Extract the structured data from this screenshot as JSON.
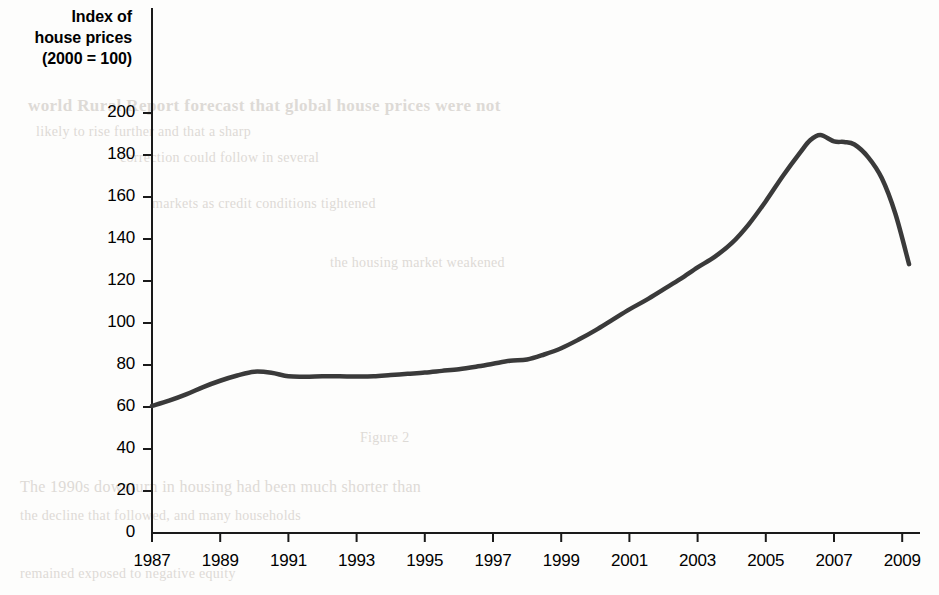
{
  "figure": {
    "axis_title_lines": [
      "Index of",
      "house prices",
      "(2000 = 100)"
    ],
    "line_color": "#3a3a3a",
    "axis_color": "#1a1a1a",
    "background_color": "#fdfdfc"
  },
  "bleed_through_text": {
    "b1": "world Rural Report forecast that global house prices were not",
    "b2": "likely to rise further and that a sharp",
    "b3": "correction could follow in several",
    "b4": "markets as credit conditions tightened",
    "b5": "the housing market weakened",
    "b6": "Figure 2",
    "b7": "The 1990s downturn in housing had been much shorter than",
    "b8": "the decline that followed, and many households",
    "b9": "remained exposed to negative equity"
  },
  "chart_data": {
    "type": "line",
    "title": "",
    "subtitle": "",
    "xlabel": "",
    "ylabel": "Index of house prices (2000 = 100)",
    "grid": false,
    "legend": "none",
    "xlim": [
      1987,
      2009.3
    ],
    "ylim": [
      0,
      200
    ],
    "xticks": [
      1987,
      1989,
      1991,
      1993,
      1995,
      1997,
      1999,
      2001,
      2003,
      2005,
      2007,
      2009
    ],
    "yticks": [
      0,
      20,
      40,
      60,
      80,
      100,
      120,
      140,
      160,
      180,
      200
    ],
    "series": [
      {
        "name": "Index of house prices (2000 = 100)",
        "x": [
          1987.0,
          1987.5,
          1988.0,
          1988.5,
          1989.0,
          1989.5,
          1990.0,
          1990.5,
          1991.0,
          1991.5,
          1992.0,
          1992.5,
          1993.0,
          1993.5,
          1994.0,
          1994.5,
          1995.0,
          1995.5,
          1996.0,
          1996.5,
          1997.0,
          1997.5,
          1998.0,
          1998.5,
          1999.0,
          1999.5,
          2000.0,
          2000.5,
          2001.0,
          2001.5,
          2002.0,
          2002.5,
          2003.0,
          2003.5,
          2004.0,
          2004.5,
          2005.0,
          2005.5,
          2006.0,
          2006.3,
          2006.6,
          2007.0,
          2007.3,
          2007.6,
          2008.0,
          2008.4,
          2008.8,
          2009.2
        ],
        "y": [
          60.5,
          63.0,
          66.0,
          69.5,
          72.5,
          75.0,
          76.8,
          76.3,
          74.6,
          74.4,
          74.6,
          74.6,
          74.5,
          74.6,
          75.2,
          75.8,
          76.4,
          77.2,
          78.0,
          79.2,
          80.6,
          82.0,
          82.6,
          85.0,
          88.0,
          92.0,
          96.5,
          101.5,
          106.5,
          111.0,
          116.0,
          121.0,
          126.5,
          131.5,
          138.0,
          147.0,
          158.0,
          170.0,
          181.0,
          187.0,
          189.5,
          186.5,
          186.2,
          185.0,
          179.0,
          169.0,
          152.0,
          128.0
        ]
      }
    ],
    "annotations": {
      "start_value": 60.5,
      "early_peak_value": 76.8,
      "early_peak_year": 1990,
      "trough_value": 74.4,
      "trough_year": 1991.5,
      "peak_value": 189.5,
      "peak_year": 2006.6,
      "end_value": 128.0,
      "end_year": 2009.2
    }
  }
}
